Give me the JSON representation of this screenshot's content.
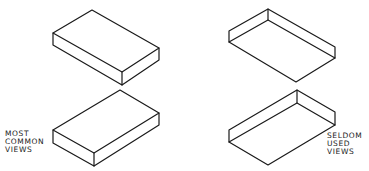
{
  "diagram": {
    "type": "isometric-view-comparison",
    "stroke_color": "#1a1a1a",
    "background": "#ffffff",
    "boxes": [
      {
        "id": "top-left",
        "view": "top view (viewed from above)",
        "group": "most_common"
      },
      {
        "id": "top-right",
        "view": "bottom view (viewed from below)",
        "group": "seldom_used"
      },
      {
        "id": "bottom-left",
        "view": "top view (viewed from above, rotated)",
        "group": "most_common"
      },
      {
        "id": "bottom-right",
        "view": "bottom view (viewed from below, rotated)",
        "group": "seldom_used"
      }
    ],
    "labels": {
      "most_common": [
        "MOST",
        "COMMON",
        "VIEWS"
      ],
      "seldom_used": [
        "SELDOM",
        "USED",
        "VIEWS"
      ]
    }
  }
}
